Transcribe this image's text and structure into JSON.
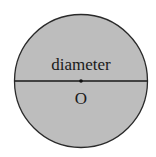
{
  "diagram": {
    "type": "circle",
    "fill_color": "#bdbdbd",
    "stroke_color": "#2a2a2a",
    "labels": {
      "diameter": "diameter",
      "center": "O"
    }
  }
}
